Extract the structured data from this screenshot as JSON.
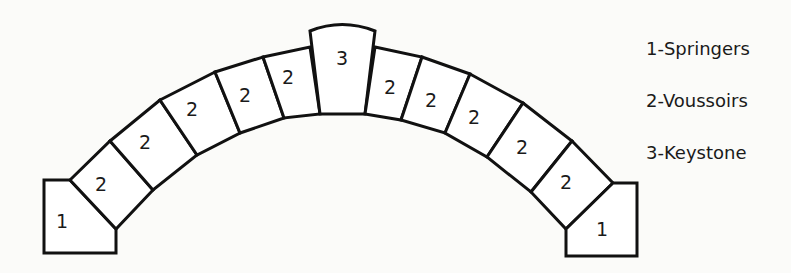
{
  "figure": {
    "stones": [
      {
        "id": "springer-left",
        "number": "1",
        "points": "44,180 70,180 116,229 116,253 44,253",
        "label_xy": [
          62,
          222
        ]
      },
      {
        "id": "voussoir-l1",
        "number": "2",
        "points": "70,180 110,141 153,190 116,229",
        "label_xy": [
          101,
          185
        ]
      },
      {
        "id": "voussoir-l2",
        "number": "2",
        "points": "110,141 160,100 197,155 153,190",
        "label_xy": [
          145,
          143
        ]
      },
      {
        "id": "voussoir-l3",
        "number": "2",
        "points": "160,100 215,72 240,133 197,155",
        "label_xy": [
          192,
          110
        ]
      },
      {
        "id": "voussoir-l4",
        "number": "2",
        "points": "215,72 263,57 284,118 240,133",
        "label_xy": [
          245,
          96
        ]
      },
      {
        "id": "voussoir-l5",
        "number": "2",
        "points": "263,57 310,47 320,114 284,118",
        "label_xy": [
          288,
          78
        ]
      },
      {
        "id": "keystone",
        "number": "3",
        "points": "310,31 Q342,18 375,31 L365,114 L320,114 Z",
        "label_xy": [
          342,
          59
        ]
      },
      {
        "id": "voussoir-r1",
        "number": "2",
        "points": "375,47 422,57 401,120 365,114",
        "label_xy": [
          390,
          88
        ]
      },
      {
        "id": "voussoir-r2",
        "number": "2",
        "points": "422,57 470,74 445,133 401,120",
        "label_xy": [
          431,
          101
        ]
      },
      {
        "id": "voussoir-r3",
        "number": "2",
        "points": "470,74 523,103 487,157 445,133",
        "label_xy": [
          474,
          118
        ]
      },
      {
        "id": "voussoir-r4",
        "number": "2",
        "points": "523,103 572,141 531,192 487,157",
        "label_xy": [
          522,
          148
        ]
      },
      {
        "id": "voussoir-r5",
        "number": "2",
        "points": "572,141 613,183 566,229 531,192",
        "label_xy": [
          566,
          183
        ]
      },
      {
        "id": "springer-right",
        "number": "1",
        "points": "613,183 637,183 637,256 566,256 566,229",
        "label_xy": [
          602,
          230
        ]
      }
    ]
  },
  "legend": {
    "items": [
      {
        "label": "1-Springers"
      },
      {
        "label": "2-Voussoirs"
      },
      {
        "label": "3-Keystone"
      }
    ]
  },
  "colors": {
    "stroke": "#111111",
    "stone_fill": "#ffffff",
    "background": "#fbfbf9",
    "text": "#1a1a1a"
  }
}
